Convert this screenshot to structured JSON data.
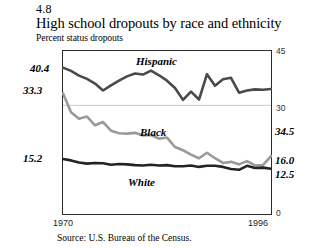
{
  "figure": {
    "number": "4.8",
    "title": "High school dropouts by race and ethnicity",
    "subtitle": "Percent status dropouts",
    "source": "Source:  U.S. Bureau of the Census."
  },
  "axis": {
    "y_ticks": [
      "45",
      "30",
      "0"
    ],
    "x_start": "1970",
    "x_end": "1996"
  },
  "endpoints": {
    "hispanic_start": "40.4",
    "black_start": "33.3",
    "white_start": "15.2",
    "hispanic_end": "34.5",
    "black_end": "16.0",
    "white_end": "12.5"
  },
  "series_names": {
    "hispanic": "Hispanic",
    "black": "Black",
    "white": "White"
  },
  "colors": {
    "hispanic": "#4a4a4a",
    "black": "#9a9a9a",
    "white": "#232323",
    "frame": "#2b2b2b",
    "gridline": "#c8c8c8"
  },
  "chart_data": {
    "type": "line",
    "title": "High school dropouts by race and ethnicity",
    "subtitle": "Percent status dropouts",
    "xlabel": "",
    "ylabel": "Percent status dropouts",
    "ylim": [
      0,
      45
    ],
    "yticks": [
      0,
      30,
      45
    ],
    "gridlines": [
      30
    ],
    "legend": "inline-labels",
    "x": [
      1970,
      1971,
      1972,
      1973,
      1974,
      1975,
      1976,
      1977,
      1978,
      1979,
      1980,
      1981,
      1982,
      1983,
      1984,
      1985,
      1986,
      1987,
      1988,
      1989,
      1990,
      1991,
      1992,
      1993,
      1994,
      1995,
      1996
    ],
    "series": [
      {
        "name": "Hispanic",
        "color": "#4a4a4a",
        "start_value": 40.4,
        "end_value": 34.5,
        "values": [
          40.4,
          39.5,
          38.2,
          37.3,
          36.0,
          34.1,
          35.5,
          36.8,
          38.0,
          38.8,
          38.5,
          39.6,
          38.3,
          36.8,
          34.8,
          31.5,
          33.8,
          31.6,
          38.6,
          35.4,
          37.2,
          37.6,
          33.5,
          34.1,
          34.4,
          34.3,
          34.5
        ]
      },
      {
        "name": "Black",
        "color": "#9a9a9a",
        "start_value": 33.3,
        "end_value": 16.0,
        "values": [
          33.3,
          28.1,
          26.3,
          26.9,
          24.5,
          25.4,
          23.0,
          22.3,
          22.2,
          22.4,
          21.7,
          21.8,
          20.8,
          21.1,
          18.5,
          17.6,
          16.4,
          15.4,
          16.9,
          15.4,
          14.1,
          14.4,
          13.7,
          14.6,
          13.4,
          13.5,
          16.0
        ]
      },
      {
        "name": "White",
        "color": "#232323",
        "start_value": 15.2,
        "end_value": 12.5,
        "values": [
          15.2,
          14.8,
          14.2,
          13.9,
          14.1,
          14.0,
          13.6,
          13.8,
          13.7,
          13.5,
          13.4,
          13.6,
          13.4,
          13.5,
          13.2,
          13.2,
          13.4,
          13.0,
          13.3,
          13.3,
          13.0,
          12.4,
          12.2,
          13.3,
          12.7,
          12.8,
          12.5
        ]
      }
    ]
  }
}
